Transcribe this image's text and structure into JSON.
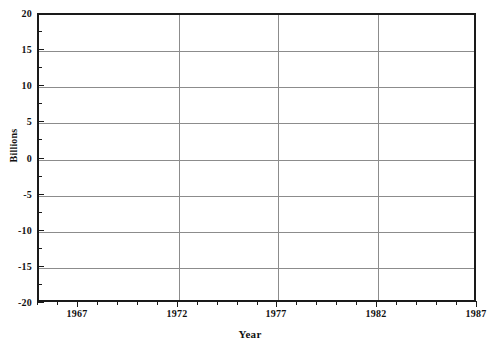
{
  "chart_data": {
    "type": "line",
    "title": "",
    "xlabel": "Year",
    "ylabel": "Billions",
    "xlim": [
      1965,
      1987
    ],
    "ylim": [
      -20,
      20
    ],
    "grid": true,
    "legend": null,
    "series": [],
    "x": [],
    "xticks": [
      1965,
      1966,
      1967,
      1968,
      1969,
      1970,
      1971,
      1972,
      1973,
      1974,
      1975,
      1976,
      1977,
      1978,
      1979,
      1980,
      1981,
      1982,
      1983,
      1984,
      1985,
      1986,
      1987
    ],
    "xticklabels": [
      {
        "value": 1967,
        "label": "1967"
      },
      {
        "value": 1972,
        "label": "1972"
      },
      {
        "value": 1977,
        "label": "1977"
      },
      {
        "value": 1982,
        "label": "1982"
      },
      {
        "value": 1987,
        "label": "1987"
      }
    ],
    "xgridlines": [
      1972,
      1977,
      1982
    ],
    "yticks": [
      -20,
      -17.5,
      -15,
      -12.5,
      -10,
      -7.5,
      -5,
      -2.5,
      0,
      2.5,
      5,
      7.5,
      10,
      12.5,
      15,
      17.5,
      20
    ],
    "yticklabels": [
      {
        "value": 20,
        "label": "20"
      },
      {
        "value": 15,
        "label": "15"
      },
      {
        "value": 10,
        "label": "10"
      },
      {
        "value": 5,
        "label": "5"
      },
      {
        "value": 0,
        "label": "0"
      },
      {
        "value": -5,
        "label": "-5"
      },
      {
        "value": -10,
        "label": "-10"
      },
      {
        "value": -15,
        "label": "-15"
      },
      {
        "value": -20,
        "label": "-20"
      }
    ],
    "ygridlines": [
      15,
      10,
      5,
      0,
      -5,
      -10,
      -15
    ],
    "colors": {
      "frame": "#1a1a1a",
      "gridline": "#8c8c8c",
      "background": "#ffffff",
      "text": "#111111"
    }
  }
}
